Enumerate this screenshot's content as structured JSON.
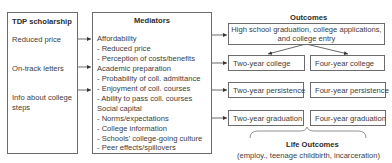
{
  "inputs": {
    "title": "TDP scholarship",
    "items": [
      "Reduced price",
      "On-track letters",
      "Info about college",
      "steps"
    ]
  },
  "mediators": {
    "title": "Mediators",
    "lines": [
      "Affordability",
      "- Reduced price",
      "- Perception of costs/benefits",
      "Academic preparation",
      "- Probability of coll. admittance",
      "- Enjoyment of coll. courses",
      "- Ability to pass coll. courses",
      "Social capital",
      "- Norms/expectations",
      "- College information",
      "- Schools' college-going culture",
      "- Peer effects/spillovers"
    ]
  },
  "outcomes": {
    "title": "Outcomes",
    "top_line1": "High school graduation, college applications,",
    "top_line2": "and college entry",
    "two_year_college": "Two-year college",
    "four_year_college": "Four-year college",
    "two_year_persistence": "Two-year persistence",
    "four_year_persistence": "Four-year persistence",
    "two_year_graduation": "Two-year graduation",
    "four_year_graduation": "Four-year graduation"
  },
  "life_outcomes": {
    "title": "Life Outcomes",
    "subtitle": "(employ., teenage childbirth, incarceration)"
  }
}
